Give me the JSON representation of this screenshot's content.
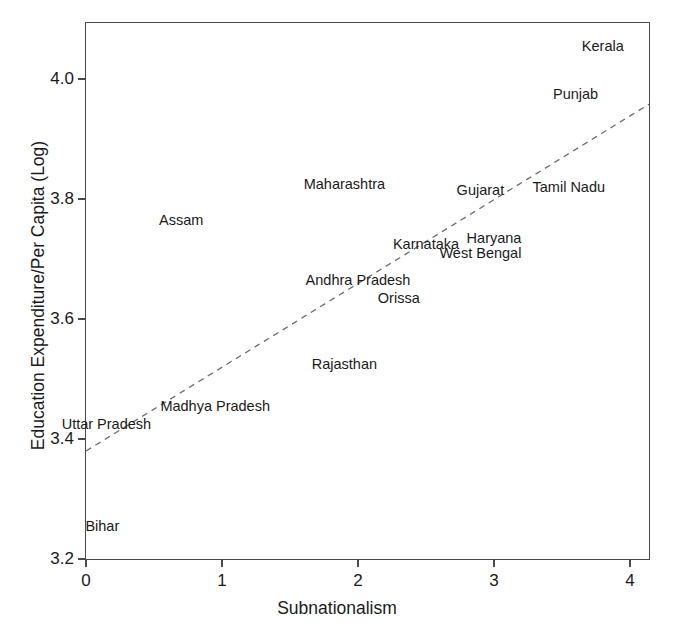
{
  "chart_data": {
    "type": "scatter",
    "title": "",
    "xlabel": "Subnationalism",
    "ylabel": "Education Expenditure/Per Capita (Log)",
    "xlim": [
      0,
      4.15
    ],
    "ylim": [
      3.2,
      4.12
    ],
    "xticks": [
      "0",
      "1",
      "2",
      "3",
      "4"
    ],
    "yticks": [
      "4.0",
      "3.8",
      "3.6",
      "3.4",
      "3.2"
    ],
    "grid": false,
    "legend": "none",
    "point_style": "text-labels-only",
    "points": [
      {
        "label": "Bihar",
        "x": 0.12,
        "y": 3.255
      },
      {
        "label": "Uttar Pradesh",
        "x": 0.15,
        "y": 3.425
      },
      {
        "label": "Madhya Pradesh",
        "x": 0.95,
        "y": 3.455
      },
      {
        "label": "Assam",
        "x": 0.7,
        "y": 3.765
      },
      {
        "label": "Rajasthan",
        "x": 1.9,
        "y": 3.525
      },
      {
        "label": "Andhra Pradesh",
        "x": 2.0,
        "y": 3.665
      },
      {
        "label": "Orissa",
        "x": 2.3,
        "y": 3.635
      },
      {
        "label": "Maharashtra",
        "x": 1.9,
        "y": 3.825
      },
      {
        "label": "Karnataka",
        "x": 2.5,
        "y": 3.725
      },
      {
        "label": "Gujarat",
        "x": 2.9,
        "y": 3.815
      },
      {
        "label": "Haryana",
        "x": 3.0,
        "y": 3.735
      },
      {
        "label": "West Bengal",
        "x": 2.9,
        "y": 3.71
      },
      {
        "label": "Tamil Nadu",
        "x": 3.55,
        "y": 3.82
      },
      {
        "label": "Punjab",
        "x": 3.6,
        "y": 3.975
      },
      {
        "label": "Kerala",
        "x": 3.8,
        "y": 4.055
      }
    ],
    "trendline": {
      "type": "dashed-linear-fit",
      "x_start": 0.0,
      "y_start": 3.38,
      "x_end": 4.14,
      "y_end": 3.958
    }
  },
  "axes": {
    "x": {
      "title": "Subnationalism",
      "ticks": [
        {
          "value": 0,
          "label": "0"
        },
        {
          "value": 1,
          "label": "1"
        },
        {
          "value": 2,
          "label": "2"
        },
        {
          "value": 3,
          "label": "3"
        },
        {
          "value": 4,
          "label": "4"
        }
      ]
    },
    "y": {
      "title": "Education Expenditure/Per Capita (Log)",
      "ticks": [
        {
          "value": 4.0,
          "label": "4.0"
        },
        {
          "value": 3.8,
          "label": "3.8"
        },
        {
          "value": 3.6,
          "label": "3.6"
        },
        {
          "value": 3.4,
          "label": "3.4"
        },
        {
          "value": 3.2,
          "label": "3.2"
        }
      ]
    }
  },
  "colors": {
    "axis": "#4a4a4a",
    "text": "#1a1a1a",
    "trendline": "#6b6b6b",
    "background": "#ffffff"
  }
}
